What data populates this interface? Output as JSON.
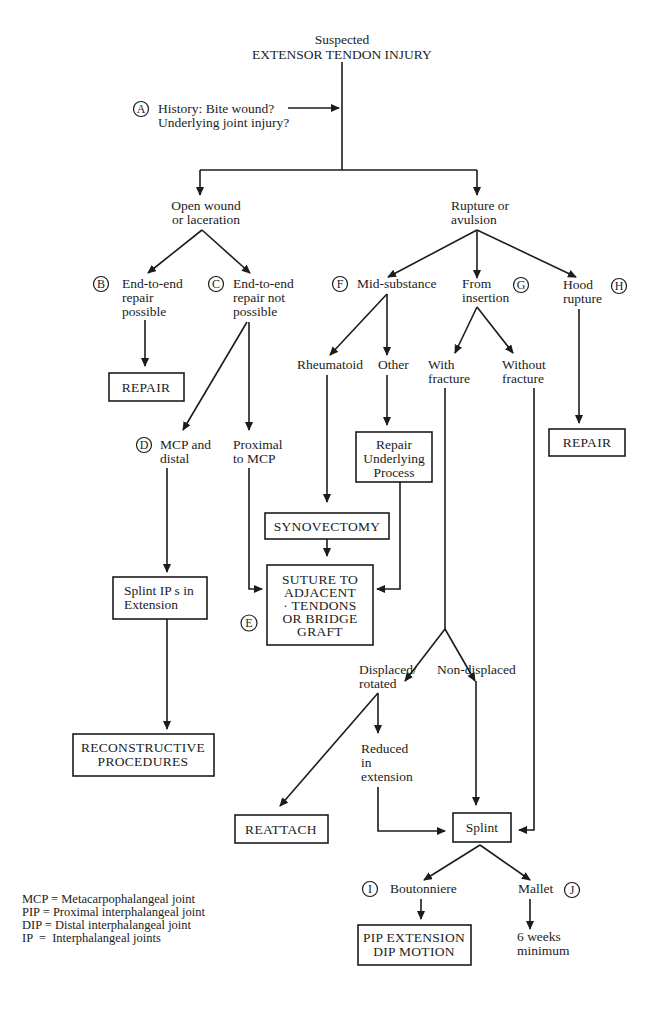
{
  "title": {
    "line1": "Suspected",
    "line2": "EXTENSOR TENDON INJURY"
  },
  "markers": {
    "A": "A",
    "B": "B",
    "C": "C",
    "D": "D",
    "E": "E",
    "F": "F",
    "G": "G",
    "H": "H",
    "I": "I",
    "J": "J"
  },
  "history": {
    "line1": "History: Bite wound?",
    "line2": "Underlying joint injury?"
  },
  "branches": {
    "open": {
      "line1": "Open wound",
      "line2": "or laceration"
    },
    "rupture": {
      "line1": "Rupture or",
      "line2": "avulsion"
    }
  },
  "open_wound": {
    "possible": {
      "line1": "End-to-end",
      "line2": "repair",
      "line3": "possible"
    },
    "not_possible": {
      "line1": "End-to-end",
      "line2": "repair not",
      "line3": "possible"
    },
    "repair_box": "REPAIR",
    "mcp_distal": {
      "line1": "MCP and",
      "line2": "distal"
    },
    "proximal_mcp": {
      "line1": "Proximal",
      "line2": "to MCP"
    },
    "splint_ips": {
      "line1": "Splint IP s in",
      "line2": "Extension"
    },
    "reconstructive": {
      "line1": "RECONSTRUCTIVE",
      "line2": "PROCEDURES"
    }
  },
  "rupture": {
    "mid_substance": "Mid-substance",
    "from_insertion": {
      "line1": "From",
      "line2": "insertion"
    },
    "hood_rupture": {
      "line1": "Hood",
      "line2": "rupture"
    },
    "rheumatoid": "Rheumatoid",
    "other": "Other",
    "repair_underlying": {
      "line1": "Repair",
      "line2": "Underlying",
      "line3": "Process"
    },
    "synovectomy": "SYNOVECTOMY",
    "suture": {
      "line1": "SUTURE TO",
      "line2": "ADJACENT",
      "line3": "· TENDONS",
      "line4": "OR BRIDGE",
      "line5": "GRAFT"
    },
    "with_fracture": {
      "line1": "With",
      "line2": "fracture"
    },
    "without_fracture": {
      "line1": "Without",
      "line2": "fracture"
    },
    "hood_repair": "REPAIR",
    "displaced": {
      "line1": "Displaced/",
      "line2": "rotated"
    },
    "non_displaced": "Non-displaced",
    "reduced": {
      "line1": "Reduced",
      "line2": "in",
      "line3": "extension"
    },
    "reattach": "REATTACH",
    "splint": "Splint",
    "boutonniere": "Boutonniere",
    "mallet": "Mallet",
    "pip_dip": {
      "line1": "PIP EXTENSION",
      "line2": "DIP MOTION"
    },
    "six_weeks": {
      "line1": "6 weeks",
      "line2": "minimum"
    }
  },
  "legend": [
    "MCP = Metacarpophalangeal joint",
    "PIP = Proximal interphalangeal joint",
    "DIP = Distal interphalangeal joint",
    "IP  =  Interphalangeal joints"
  ]
}
